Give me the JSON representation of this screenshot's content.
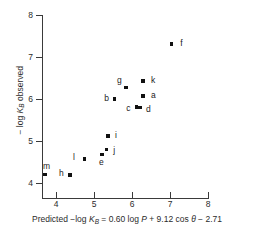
{
  "chart_data": {
    "type": "scatter",
    "title": "",
    "xlabel": "Predicted −log K_B = 0.60 log P + 9.12 cos θ − 2.71",
    "ylabel": "−log K_B observed",
    "xlim": [
      3.5,
      8.0
    ],
    "ylim": [
      3.6,
      8.0
    ],
    "xticks": [
      4,
      5,
      6,
      7,
      8
    ],
    "yticks": [
      4,
      5,
      6,
      7,
      8
    ],
    "xtick_labels": [
      "4",
      "5",
      "6",
      "7",
      "8"
    ],
    "ytick_labels": [
      "4",
      "5",
      "6",
      "7",
      "8"
    ],
    "grid": false,
    "legend": false,
    "marker": "square",
    "marker_color": "#111111",
    "axis_color": "#3a3a3a",
    "points": [
      {
        "label": "f",
        "x": 7.03,
        "y": 7.31,
        "lx": 9,
        "ly": -5
      },
      {
        "label": "k",
        "x": 6.29,
        "y": 6.43,
        "lx": 8,
        "ly": -5
      },
      {
        "label": "g",
        "x": 5.84,
        "y": 6.27,
        "lx": -9,
        "ly": -12
      },
      {
        "label": "a",
        "x": 6.29,
        "y": 6.07,
        "lx": 8,
        "ly": -5
      },
      {
        "label": "b",
        "x": 5.53,
        "y": 6.0,
        "lx": -10,
        "ly": -5
      },
      {
        "label": "c",
        "x": 6.11,
        "y": 5.81,
        "lx": -10,
        "ly": -3
      },
      {
        "label": "d",
        "x": 6.21,
        "y": 5.79,
        "lx": 6,
        "ly": -3
      },
      {
        "label": "i",
        "x": 5.37,
        "y": 5.12,
        "lx": 7,
        "ly": -5
      },
      {
        "label": "j",
        "x": 5.32,
        "y": 4.79,
        "lx": 7,
        "ly": -4
      },
      {
        "label": "e",
        "x": 5.21,
        "y": 4.67,
        "lx": -3,
        "ly": 3
      },
      {
        "label": "l",
        "x": 4.74,
        "y": 4.57,
        "lx": -11,
        "ly": -6
      },
      {
        "label": "m",
        "x": 3.71,
        "y": 4.21,
        "lx": -2,
        "ly": -12
      },
      {
        "label": "h",
        "x": 4.37,
        "y": 4.19,
        "lx": -11,
        "ly": -6
      }
    ]
  },
  "axis_caption": {
    "prefix": "Predicted  −log ",
    "sym": "K",
    "sub": "B",
    "equals": " = 0.60 log ",
    "p": "P",
    "mid": " + 9.12 cos ",
    "theta": "θ",
    "tail": " − 2.71"
  },
  "y_caption": {
    "prefix": "− log ",
    "sym": "K",
    "sub": "B",
    "tail": " observed"
  }
}
